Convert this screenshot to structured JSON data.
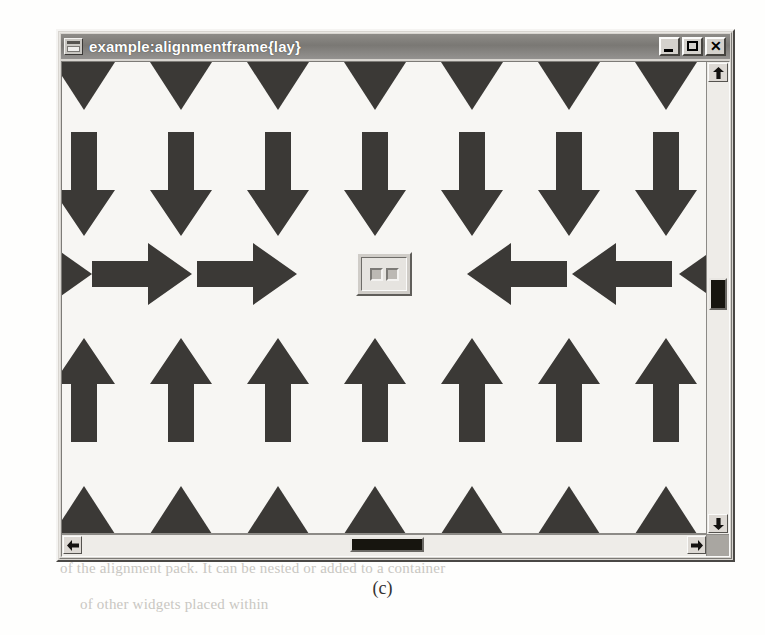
{
  "window": {
    "title": "example:alignmentframe{lay}",
    "icon": "window-document-icon",
    "caption_buttons": [
      {
        "name": "minimize",
        "label": "_"
      },
      {
        "name": "maximize",
        "label": "□"
      },
      {
        "name": "close",
        "label": "✕"
      }
    ]
  },
  "scrollbars": {
    "vertical": {
      "up_label": "▲",
      "down_label": "▼",
      "thumb_top_px": 216,
      "thumb_height_px": 32
    },
    "horizontal": {
      "left_label": "◀",
      "right_label": "▶",
      "thumb_left_px": 288,
      "thumb_width_px": 74
    }
  },
  "canvas": {
    "background_color": "#f7f6f3",
    "arrow_color": "#3b3936",
    "columns_x": [
      22,
      119,
      216,
      313,
      410,
      507,
      604
    ],
    "rows": [
      {
        "name": "top-clipped-arrowheads",
        "direction": "down",
        "clipped": true,
        "count": 7
      },
      {
        "name": "top-down-arrows",
        "direction": "down",
        "clipped": false,
        "count": 7
      },
      {
        "name": "middle-inward-arrows",
        "direction": "horizontal",
        "clipped": false,
        "count": 6
      },
      {
        "name": "bottom-up-arrows",
        "direction": "up",
        "clipped": false,
        "count": 7
      },
      {
        "name": "bottom-clipped-arrowheads",
        "direction": "up",
        "clipped": true,
        "count": 7
      }
    ],
    "center_widget": {
      "name": "alignment-frame-widget",
      "inner_squares": 2
    }
  },
  "figure": {
    "caption": "(c)"
  },
  "ghost_text": [
    {
      "x": 95,
      "y": 62,
      "text": "the arrows in the corners are elongated to fill the whole"
    },
    {
      "x": 88,
      "y": 88,
      "text": "window. Normally, this is not needed, because the widget"
    },
    {
      "x": 88,
      "y": 112,
      "text": "will simply continue as the layer above it does in the"
    },
    {
      "x": 92,
      "y": 140,
      "text": "whole frame is allotted to the alignment"
    },
    {
      "x": 80,
      "y": 168,
      "text": "character."
    },
    {
      "x": 66,
      "y": 212,
      "text": "the position and size of the resulting item depend on the settings of"
    },
    {
      "x": 66,
      "y": 238,
      "text": "its parent. It is possible to pack a sub-alignment frame into"
    },
    {
      "x": 90,
      "y": 264,
      "text": "another alignment, yielding a nested arrangement."
    },
    {
      "x": 74,
      "y": 290,
      "text": "so when the shape is skewed in the opposite direction the"
    },
    {
      "x": 82,
      "y": 316,
      "text": "space would be scaled with contiguous pairs of points, or the"
    },
    {
      "x": 94,
      "y": 342,
      "text": "widget."
    },
    {
      "x": 70,
      "y": 388,
      "text": "once collected the label the pack had to be more than only the"
    },
    {
      "x": 80,
      "y": 436,
      "text": "at the arrow accompanying with another parameter of its set"
    },
    {
      "x": 76,
      "y": 462,
      "text": "same configuration that can be examined in the diagram above."
    },
    {
      "x": 66,
      "y": 494,
      "text": "Remember, the arrow set is defined as the same and the item"
    },
    {
      "x": 66,
      "y": 520,
      "text": "is an operation in a frame that can be filled with a different version"
    },
    {
      "x": 60,
      "y": 560,
      "text": "of the alignment pack. It can be nested or added to a container"
    },
    {
      "x": 80,
      "y": 596,
      "text": "of other widgets placed within"
    }
  ]
}
